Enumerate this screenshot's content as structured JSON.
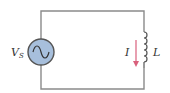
{
  "circuit": {
    "source": {
      "label": "V",
      "subscript": "S",
      "type": "ac-voltage-source",
      "fill": "#a7bfdc"
    },
    "inductor": {
      "label": "L"
    },
    "current": {
      "label": "I",
      "direction": "down",
      "color": "#d9607c"
    },
    "wire_color": "#8a8a8a"
  }
}
